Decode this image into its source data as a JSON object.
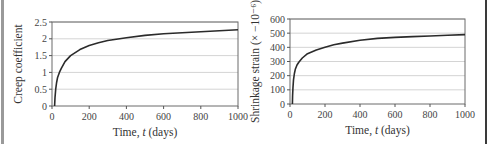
{
  "chart_data": [
    {
      "type": "line",
      "title": "",
      "xlabel": "Time, t (days)",
      "xlabel_parts": [
        "Time, ",
        "t",
        " (days)"
      ],
      "ylabel": "Creep coefficient",
      "xlim": [
        0,
        1000
      ],
      "ylim": [
        0,
        2.5
      ],
      "xticks": [
        0,
        200,
        400,
        600,
        800,
        1000
      ],
      "yticks": [
        0,
        0.5,
        1,
        1.5,
        2,
        2.5
      ],
      "ytick_labels": [
        "0",
        "0.5",
        "1",
        "1.5",
        "2",
        "2.5"
      ],
      "grid": "horizontal",
      "legend": "none",
      "series": [
        {
          "name": "Creep coefficient",
          "x": [
            14,
            16,
            20,
            25,
            30,
            40,
            50,
            70,
            100,
            150,
            200,
            250,
            300,
            400,
            500,
            600,
            700,
            800,
            900,
            1000
          ],
          "y": [
            0,
            0.25,
            0.5,
            0.7,
            0.85,
            1.0,
            1.12,
            1.32,
            1.5,
            1.68,
            1.8,
            1.88,
            1.95,
            2.03,
            2.1,
            2.15,
            2.18,
            2.21,
            2.24,
            2.27
          ]
        }
      ]
    },
    {
      "type": "line",
      "title": "",
      "xlabel": "Time, t (days)",
      "xlabel_parts": [
        "Time, ",
        "t",
        " (days)"
      ],
      "ylabel": "Shrinkage strain (× −10⁻⁶)",
      "xlim": [
        0,
        1000
      ],
      "ylim": [
        0,
        600
      ],
      "xticks": [
        0,
        200,
        400,
        600,
        800,
        1000
      ],
      "yticks": [
        0,
        100,
        200,
        300,
        400,
        500,
        600
      ],
      "ytick_labels": [
        "0",
        "100",
        "200",
        "300",
        "400",
        "500",
        "600"
      ],
      "grid": "horizontal",
      "legend": "none",
      "series": [
        {
          "name": "Shrinkage strain",
          "x": [
            14,
            15,
            17,
            20,
            25,
            30,
            40,
            50,
            70,
            100,
            150,
            200,
            250,
            300,
            400,
            500,
            600,
            700,
            800,
            900,
            1000
          ],
          "y": [
            0,
            60,
            120,
            170,
            215,
            245,
            275,
            295,
            325,
            355,
            382,
            400,
            418,
            430,
            450,
            463,
            470,
            476,
            480,
            485,
            490
          ]
        }
      ]
    }
  ]
}
